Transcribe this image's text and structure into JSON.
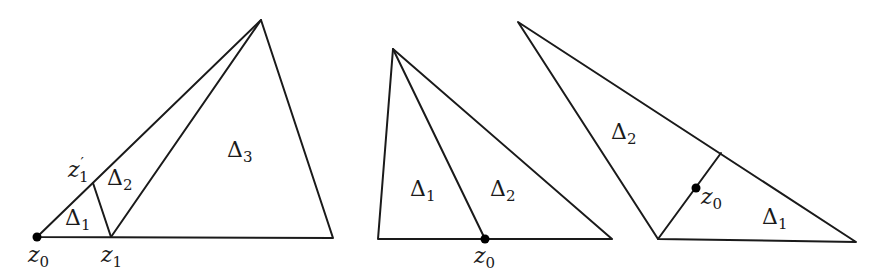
{
  "figure": {
    "panels": [
      {
        "id": "left",
        "polygons": [
          {
            "name": "outer-triangle",
            "points": [
              [
                37,
                237
              ],
              [
                261,
                20
              ],
              [
                333,
                238
              ]
            ]
          }
        ],
        "segments": [
          {
            "name": "edge-z1-z1prime",
            "from": [
              111,
              237
            ],
            "to": [
              93,
              183
            ]
          },
          {
            "name": "edge-z1-apex",
            "from": [
              111,
              237
            ],
            "to": [
              261,
              20
            ]
          }
        ],
        "points": [
          {
            "name": "z0",
            "at": [
              37,
              237
            ],
            "marked": true
          }
        ],
        "labels": {
          "delta1": {
            "base": "Δ",
            "sub": "1",
            "x": 65,
            "y": 225
          },
          "delta2": {
            "base": "Δ",
            "sub": "2",
            "x": 107,
            "y": 185
          },
          "delta3": {
            "base": "Δ",
            "sub": "3",
            "x": 227,
            "y": 157
          },
          "z1prime": {
            "base": "z",
            "sub": "1",
            "sup": "′",
            "x": 68,
            "y": 177
          },
          "z0": {
            "base": "z",
            "sub": "0",
            "x": 28,
            "y": 262
          },
          "z1": {
            "base": "z",
            "sub": "1",
            "x": 101,
            "y": 262
          }
        }
      },
      {
        "id": "middle",
        "polygons": [
          {
            "name": "outer-triangle",
            "points": [
              [
                378,
                239
              ],
              [
                393,
                49
              ],
              [
                612,
                239
              ]
            ]
          }
        ],
        "segments": [
          {
            "name": "edge-apex-z0",
            "from": [
              393,
              49
            ],
            "to": [
              485,
              239
            ]
          }
        ],
        "points": [
          {
            "name": "z0",
            "at": [
              485,
              239
            ],
            "marked": true
          }
        ],
        "labels": {
          "delta1": {
            "base": "Δ",
            "sub": "1",
            "x": 410,
            "y": 196
          },
          "delta2": {
            "base": "Δ",
            "sub": "2",
            "x": 490,
            "y": 196
          },
          "z0": {
            "base": "z",
            "sub": "0",
            "x": 474,
            "y": 263
          }
        }
      },
      {
        "id": "right",
        "polygons": [
          {
            "name": "outer-triangle",
            "points": [
              [
                518,
                22
              ],
              [
                856,
                242
              ],
              [
                658,
                239
              ]
            ]
          }
        ],
        "segments": [
          {
            "name": "edge-base-split",
            "from": [
              658,
              239
            ],
            "to": [
              721,
              153
            ]
          }
        ],
        "points": [
          {
            "name": "z0",
            "at": [
              696,
              188
            ],
            "marked": true
          }
        ],
        "labels": {
          "delta1": {
            "base": "Δ",
            "sub": "1",
            "x": 762,
            "y": 224
          },
          "delta2": {
            "base": "Δ",
            "sub": "2",
            "x": 611,
            "y": 139
          },
          "z0": {
            "base": "z",
            "sub": "0",
            "x": 701,
            "y": 204
          }
        }
      }
    ],
    "style": {
      "stroke": "#1a1a1a",
      "dot": "#000000",
      "background": "#ffffff"
    }
  }
}
